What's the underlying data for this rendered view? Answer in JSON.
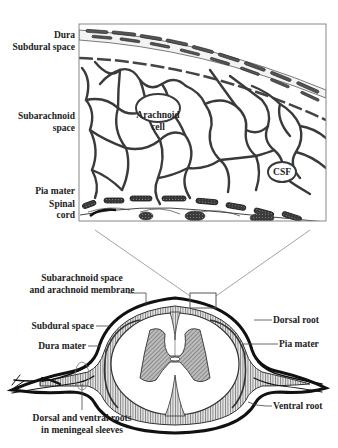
{
  "figure": {
    "type": "anatomical-diagram",
    "colors": {
      "ink": "#222222",
      "hatch_fill": "#9a9a9a",
      "dark_fill": "#3a3a3a",
      "connector": "#999999",
      "background": "#ffffff"
    }
  },
  "detail_panel": {
    "left_labels": [
      {
        "id": "dura",
        "text": "Dura"
      },
      {
        "id": "subdural",
        "text": "Subdural space"
      },
      {
        "id": "subarachnoid_1",
        "text": "Subarachnoid"
      },
      {
        "id": "subarachnoid_2",
        "text": "space"
      },
      {
        "id": "pia",
        "text": "Pia mater"
      },
      {
        "id": "spinal_1",
        "text": "Spinal"
      },
      {
        "id": "spinal_2",
        "text": "cord"
      }
    ],
    "inner_labels": [
      {
        "id": "arachnoid_1",
        "text": "Arachnoid"
      },
      {
        "id": "arachnoid_2",
        "text": "cell"
      },
      {
        "id": "csf",
        "text": "CSF"
      }
    ]
  },
  "cross_section": {
    "left_labels": [
      {
        "id": "subarach_mem_1",
        "text": "Subarachnoid space"
      },
      {
        "id": "subarach_mem_2",
        "text": "and arachnoid membrane"
      },
      {
        "id": "subdural_space",
        "text": "Subdural space"
      },
      {
        "id": "dura_mater",
        "text": "Dura mater"
      }
    ],
    "right_labels": [
      {
        "id": "dorsal_root",
        "text": "Dorsal root"
      },
      {
        "id": "pia_mater",
        "text": "Pia mater"
      },
      {
        "id": "ventral_root",
        "text": "Ventral root"
      }
    ],
    "bottom_labels": [
      {
        "id": "roots_1",
        "text": "Dorsal and ventral roots"
      },
      {
        "id": "roots_2",
        "text": "in meningeal sleeves"
      }
    ]
  }
}
